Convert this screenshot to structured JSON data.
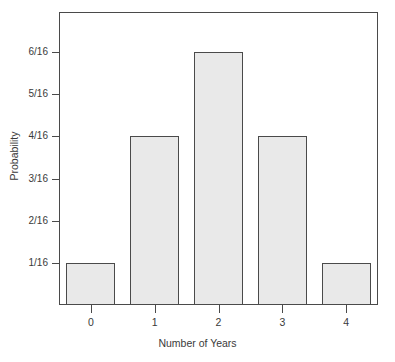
{
  "chart_data": {
    "type": "bar",
    "title": "",
    "subtitle": "",
    "xlabel": "Number of Years",
    "ylabel": "Probability",
    "categories": [
      "0",
      "1",
      "2",
      "3",
      "4"
    ],
    "values": [
      0.0625,
      0.25,
      0.375,
      0.25,
      0.0625
    ],
    "value_labels": [
      "1/16",
      "4/16",
      "6/16",
      "4/16",
      "1/16"
    ],
    "value_numerators": [
      1,
      4,
      6,
      4,
      1
    ],
    "denominator": 16,
    "ytick_labels": [
      "1/16",
      "2/16",
      "3/16",
      "4/16",
      "5/16",
      "6/16"
    ],
    "ytick_values": [
      0.0625,
      0.125,
      0.1875,
      0.25,
      0.3125,
      0.375
    ],
    "ylim": [
      0,
      0.4345
    ],
    "xlim": [
      -0.5,
      4.5
    ],
    "grid": false,
    "legend": null,
    "annotations": [],
    "bar_fill_color": "#e9e9e9",
    "bar_edge_color": "#4a4a4a",
    "frame_color": "#4a4a4a",
    "background_color": "#ffffff",
    "text_color": "#3a3a3a"
  }
}
